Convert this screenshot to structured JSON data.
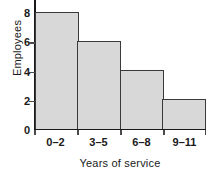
{
  "chart_data": {
    "type": "bar",
    "title": "",
    "subtitle": "",
    "xlabel": "Years of service",
    "ylabel": "Employees",
    "categories": [
      "0–2",
      "3–5",
      "6–8",
      "9–11"
    ],
    "values": [
      8,
      6,
      4,
      2
    ],
    "ylim": [
      0,
      8
    ],
    "yticks": [
      0,
      2,
      4,
      6,
      8
    ],
    "ytick_labels": [
      "0",
      "2",
      "4",
      "6",
      "8"
    ],
    "grid": false,
    "legend": false,
    "legend_position": "none",
    "bar_gap": 0,
    "colors": {
      "bar_fill": "#d8d8d8",
      "bar_edge": "#3a3a3a",
      "axis": "#1a1a1a",
      "text": "#1a1a1a",
      "background": "#ffffff"
    },
    "annotations": []
  }
}
